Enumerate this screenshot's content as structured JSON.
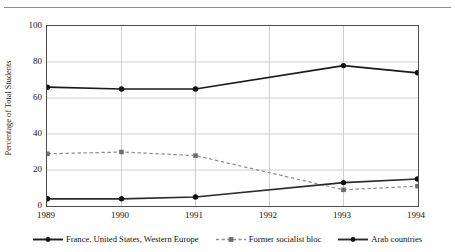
{
  "caption": {
    "text": "Table 3. Foreign Study Destinations of Tunisian Students by Region, 1989-1994 (percent)"
  },
  "chart_data": {
    "type": "line",
    "title": "",
    "xlabel": "",
    "ylabel": "Percentage of Total Students",
    "categories": [
      "1989",
      "1990",
      "1991",
      "1992",
      "1993",
      "1994"
    ],
    "x": [
      1989,
      1990,
      1991,
      1992,
      1993,
      1994
    ],
    "xlim": [
      1989,
      1994
    ],
    "ylim": [
      0,
      100
    ],
    "yticks": [
      0,
      20,
      40,
      60,
      80,
      100
    ],
    "grid": "horizontal-and-vertical",
    "legend_position": "bottom",
    "series": [
      {
        "name": "France, United States, Western Europe",
        "style": "solid",
        "color": "#1a1a1a",
        "marker": "diamond",
        "values": [
          66,
          65,
          65,
          null,
          78,
          74
        ]
      },
      {
        "name": "Former socialist bloc",
        "style": "dashed",
        "color": "#8f8f8f",
        "marker": "square",
        "values": [
          29,
          30,
          28,
          null,
          9,
          11
        ]
      },
      {
        "name": "Arab countries",
        "style": "solid",
        "color": "#2b2b2b",
        "marker": "diamond",
        "values": [
          4,
          4,
          5,
          null,
          13,
          15
        ]
      }
    ]
  },
  "axis": {
    "ytick_labels": [
      "100",
      "80",
      "60",
      "40",
      "20",
      "0"
    ],
    "xtick_labels": [
      "1989",
      "1990",
      "1991",
      "1992",
      "1993",
      "1994"
    ]
  },
  "legend": {
    "items": [
      {
        "label": "France, United States, Western Europe",
        "marker": "diamond-marker-icon"
      },
      {
        "label": "Former socialist bloc",
        "marker": "square-marker-icon"
      },
      {
        "label": "Arab countries",
        "marker": "diamond-marker-icon"
      }
    ]
  },
  "colors": {
    "series_primary": "#1a1a1a",
    "series_dashed": "#8f8f8f",
    "series_arab": "#2b2b2b",
    "gridline": "#c9c9c9",
    "axis": "#4d4d4d"
  }
}
